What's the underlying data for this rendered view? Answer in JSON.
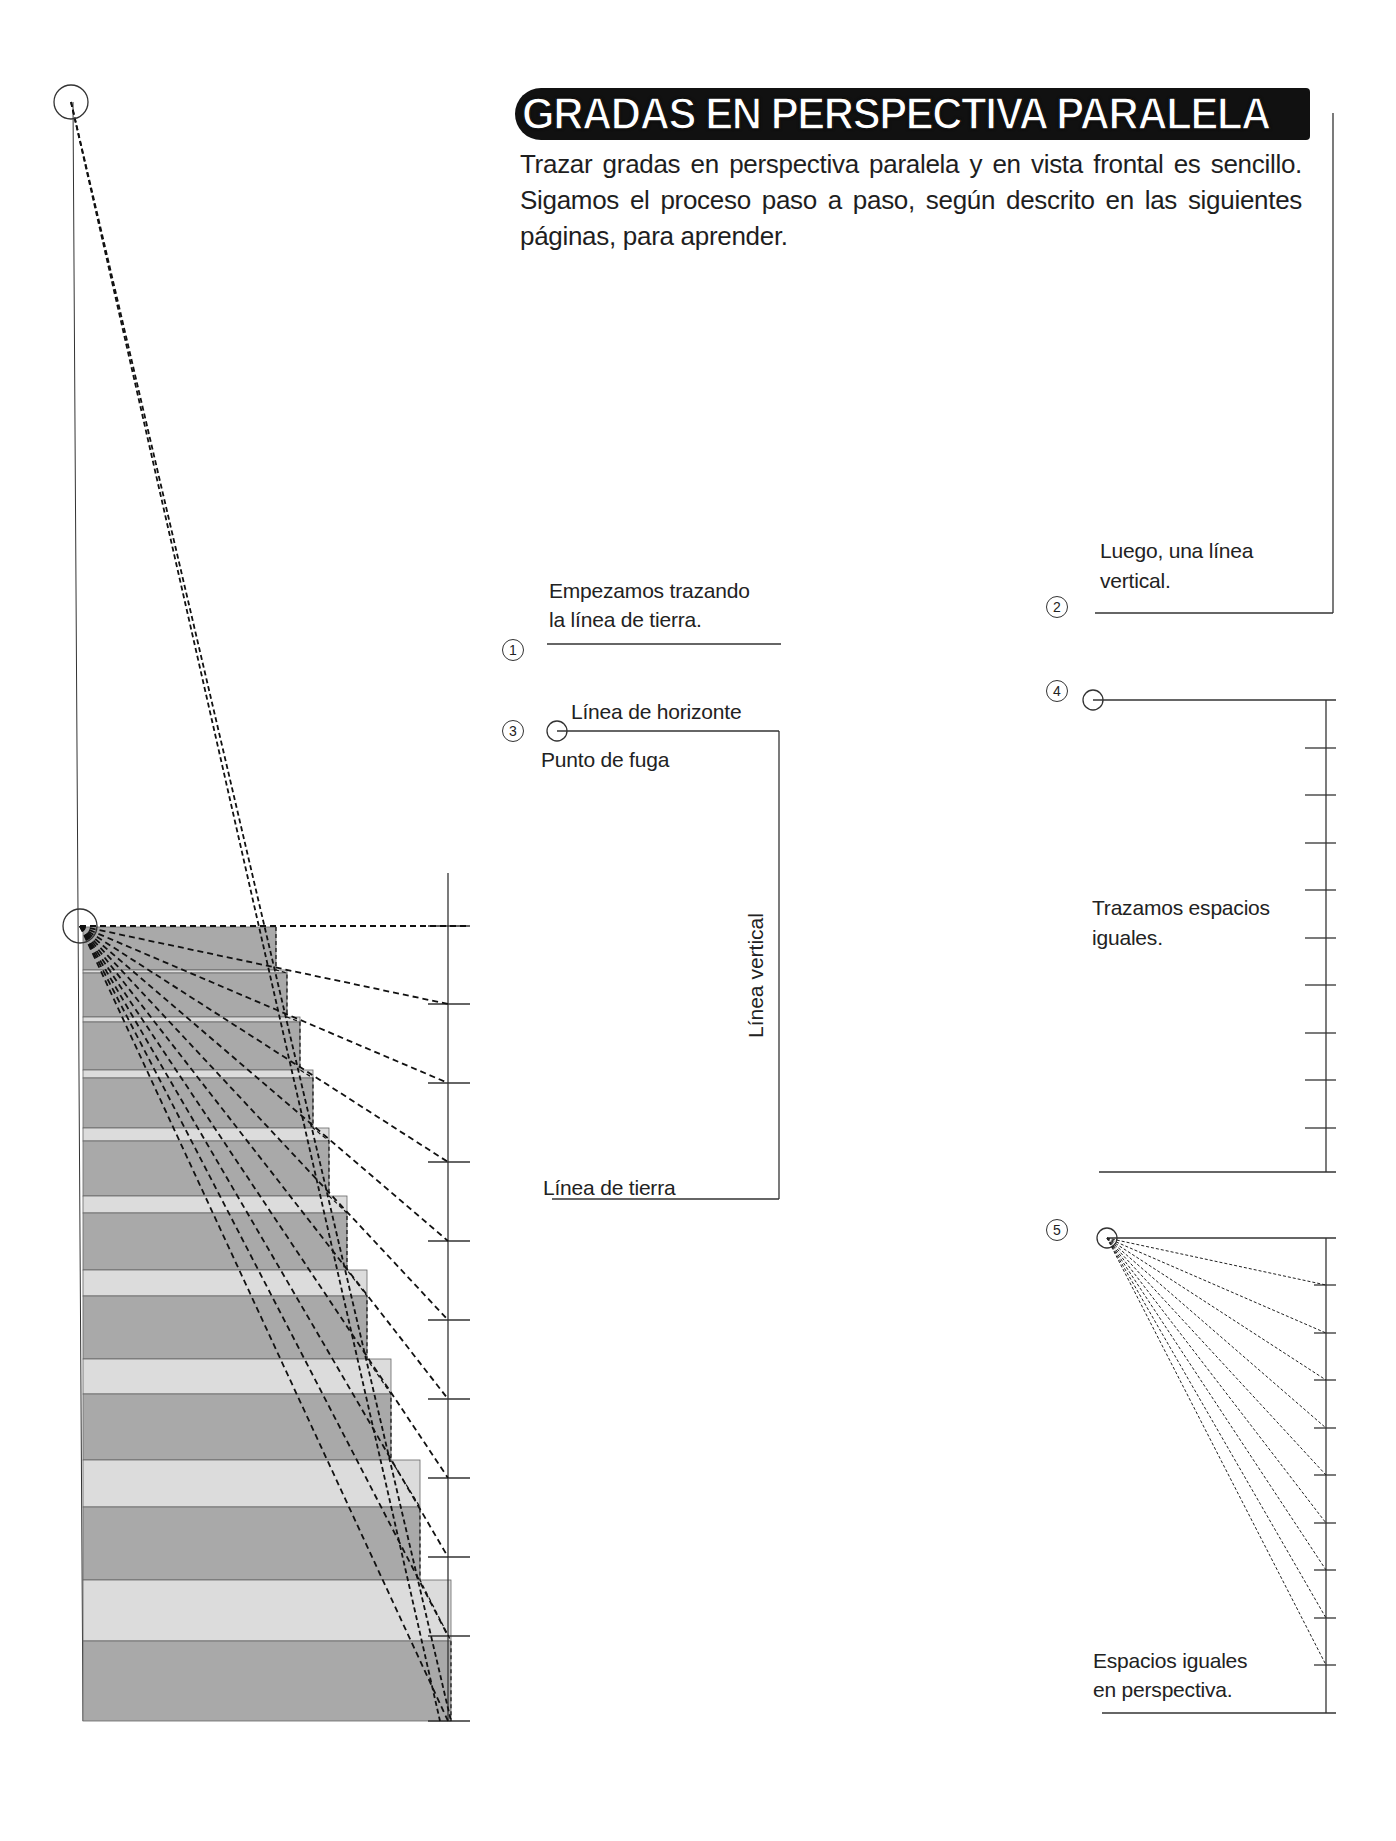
{
  "header": {
    "title": "GRADAS EN PERSPECTIVA PARALELA",
    "intro": "Trazar gradas en perspectiva paralela y en vista frontal es sencillo. Sigamos el proceso paso a paso, según descrito en las siguientes páginas, para aprender."
  },
  "steps": [
    {
      "number": "1",
      "label_line1": "Empezamos trazando",
      "label_line2": "la línea de tierra."
    },
    {
      "number": "2",
      "label_line1": "Luego, una línea",
      "label_line2": "vertical."
    },
    {
      "number": "3",
      "horizon_label": "Línea de horizonte",
      "vanishing_label": "Punto de fuga",
      "vertical_label": "Línea vertical",
      "ground_label": "Línea de tierra"
    },
    {
      "number": "4",
      "label_line1": "Trazamos espacios",
      "label_line2": "iguales."
    },
    {
      "number": "5",
      "label_line1": "Espacios iguales",
      "label_line2": "en perspectiva."
    }
  ],
  "colors": {
    "riser": "#a9a9a9",
    "tread": "#dcdcdc",
    "line": "#333333",
    "dash": "#111111",
    "title_bg": "#111111",
    "title_fg": "#ffffff"
  },
  "staircase": {
    "left_x": 83,
    "vertical_x": 448,
    "top_vanishing_point": [
      71,
      102
    ],
    "horizon_vanishing_point": [
      80,
      926
    ],
    "risers": [
      {
        "top": 927,
        "bottom": 970,
        "right": 276
      },
      {
        "top": 973,
        "bottom": 1017,
        "right": 287
      },
      {
        "top": 1022,
        "bottom": 1070,
        "right": 300
      },
      {
        "top": 1078,
        "bottom": 1128,
        "right": 313
      },
      {
        "top": 1141,
        "bottom": 1196,
        "right": 329
      },
      {
        "top": 1213,
        "bottom": 1270,
        "right": 347
      },
      {
        "top": 1296,
        "bottom": 1359,
        "right": 367
      },
      {
        "top": 1394,
        "bottom": 1460,
        "right": 391
      },
      {
        "top": 1507,
        "bottom": 1580,
        "right": 420
      },
      {
        "top": 1641,
        "bottom": 1721,
        "right": 451
      }
    ],
    "ticks": [
      926,
      1004,
      1083,
      1162,
      1241,
      1320,
      1399,
      1478,
      1557,
      1636,
      1721
    ]
  },
  "step4_ticks": [
    700,
    748,
    795,
    843,
    890,
    938,
    985,
    1033,
    1080,
    1128,
    1172
  ],
  "step5_ticks": [
    1238,
    1285,
    1333,
    1380,
    1428,
    1475,
    1523,
    1570,
    1618,
    1665,
    1713
  ]
}
